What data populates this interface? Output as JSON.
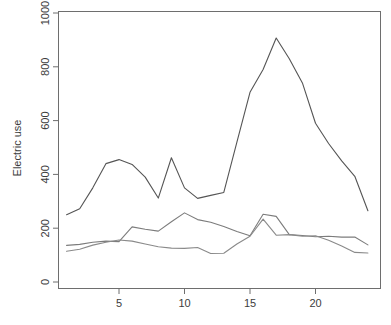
{
  "chart_data": {
    "type": "line",
    "title": "",
    "xlabel": "",
    "ylabel": "Electric use",
    "xlim": [
      1,
      24
    ],
    "ylim": [
      0,
      1030
    ],
    "grid": false,
    "legend": "none",
    "x_ticks": [
      5,
      10,
      15,
      20
    ],
    "y_ticks": [
      0,
      200,
      400,
      600,
      800,
      1000
    ],
    "x": [
      1,
      2,
      3,
      4,
      5,
      6,
      7,
      8,
      9,
      10,
      11,
      12,
      13,
      14,
      15,
      16,
      17,
      18,
      19,
      20,
      21,
      22,
      23,
      24
    ],
    "series": [
      {
        "name": "series-1",
        "color": "#555555",
        "values": [
          250,
          272,
          350,
          440,
          455,
          437,
          390,
          312,
          462,
          350,
          311,
          322,
          333,
          520,
          705,
          790,
          907,
          830,
          740,
          590,
          515,
          450,
          393,
          265
        ]
      },
      {
        "name": "series-2",
        "color": "#7c7c7c",
        "values": [
          136,
          140,
          148,
          152,
          150,
          205,
          196,
          189,
          224,
          257,
          232,
          222,
          206,
          188,
          172,
          252,
          244,
          176,
          173,
          168,
          170,
          167,
          167,
          138
        ]
      },
      {
        "name": "series-3",
        "color": "#8a8a8a",
        "values": [
          114,
          122,
          137,
          148,
          156,
          152,
          141,
          131,
          126,
          125,
          128,
          106,
          107,
          141,
          170,
          234,
          174,
          176,
          170,
          172,
          155,
          134,
          110,
          108
        ]
      }
    ]
  },
  "axes": {
    "y_axis_label": "Electric use",
    "y_tick_labels": [
      "0",
      "200",
      "400",
      "600",
      "800",
      "1000"
    ],
    "x_tick_labels": [
      "5",
      "10",
      "15",
      "20"
    ]
  },
  "colors": {
    "frame": "#6e6e6e",
    "text": "#3c3c3c",
    "background": "#ffffff"
  }
}
